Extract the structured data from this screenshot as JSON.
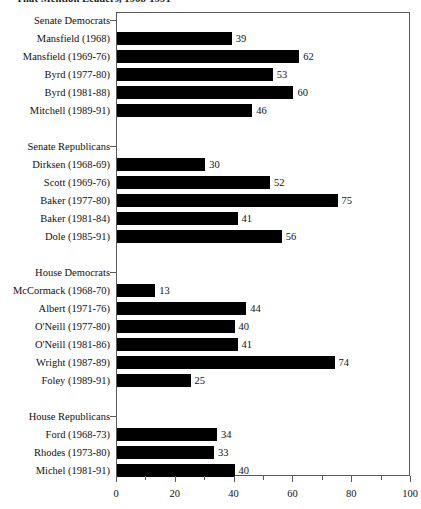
{
  "chart_data": {
    "type": "bar",
    "orientation": "horizontal",
    "title": "That Mention Leaders, 1968-1991",
    "xlabel": "",
    "ylabel": "",
    "xlim": [
      0,
      100
    ],
    "xticks": [
      0,
      20,
      40,
      60,
      80,
      100
    ],
    "xticks_minor": [
      10,
      30,
      50,
      70,
      90
    ],
    "grid": false,
    "legend": false,
    "bar_color": "#000000",
    "axis_color": "#5a5a5a",
    "groups": [
      {
        "name": "Senate Democrats",
        "rows": [
          {
            "label": "Mansfield (1968)",
            "value": 39
          },
          {
            "label": "Mansfield (1969-76)",
            "value": 62
          },
          {
            "label": "Byrd (1977-80)",
            "value": 53
          },
          {
            "label": "Byrd (1981-88)",
            "value": 60
          },
          {
            "label": "Mitchell (1989-91)",
            "value": 46
          }
        ]
      },
      {
        "name": "Senate Republicans",
        "rows": [
          {
            "label": "Dirksen (1968-69)",
            "value": 30
          },
          {
            "label": "Scott (1969-76)",
            "value": 52
          },
          {
            "label": "Baker (1977-80)",
            "value": 75
          },
          {
            "label": "Baker (1981-84)",
            "value": 41
          },
          {
            "label": "Dole (1985-91)",
            "value": 56
          }
        ]
      },
      {
        "name": "House Democrats",
        "rows": [
          {
            "label": "McCormack (1968-70)",
            "value": 13
          },
          {
            "label": "Albert (1971-76)",
            "value": 44
          },
          {
            "label": "O'Neill (1977-80)",
            "value": 40
          },
          {
            "label": "O'Neill (1981-86)",
            "value": 41
          },
          {
            "label": "Wright (1987-89)",
            "value": 74
          },
          {
            "label": "Foley (1989-91)",
            "value": 25
          }
        ]
      },
      {
        "name": "House Republicans",
        "rows": [
          {
            "label": "Ford (1968-73)",
            "value": 34
          },
          {
            "label": "Rhodes (1973-80)",
            "value": 33
          },
          {
            "label": "Michel (1981-91)",
            "value": 40
          }
        ]
      }
    ]
  }
}
